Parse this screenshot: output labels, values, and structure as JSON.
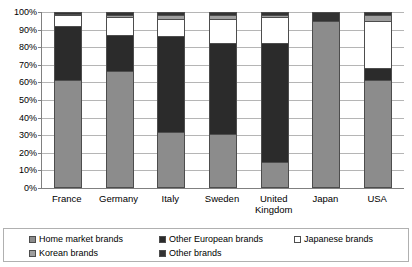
{
  "chart_data": {
    "type": "bar",
    "subtype": "stacked-100-percent",
    "title": "",
    "subtitle": "",
    "xlabel": "",
    "ylabel": "",
    "ylim": [
      0,
      100
    ],
    "y_unit": "%",
    "grid": true,
    "legend_position": "bottom",
    "categories": [
      "France",
      "Germany",
      "Italy",
      "Sweden",
      "United Kingdom",
      "Japan",
      "USA"
    ],
    "category_labels": [
      [
        "France"
      ],
      [
        "Germany"
      ],
      [
        "Italy"
      ],
      [
        "Sweden"
      ],
      [
        "United",
        "Kingdom"
      ],
      [
        "Japan"
      ],
      [
        "USA"
      ]
    ],
    "y_ticks": [
      "0%",
      "10%",
      "20%",
      "30%",
      "40%",
      "50%",
      "60%",
      "70%",
      "80%",
      "90%",
      "100%"
    ],
    "y_tick_values": [
      0,
      10,
      20,
      30,
      40,
      50,
      60,
      70,
      80,
      90,
      100
    ],
    "series": [
      {
        "name": "Home market brands",
        "color": "#8c8c8c",
        "values": [
          61,
          66,
          31,
          30,
          14,
          95,
          61
        ]
      },
      {
        "name": "Other European brands",
        "color": "#2b2b2b",
        "values": [
          31,
          21,
          55,
          52,
          68,
          0,
          7
        ]
      },
      {
        "name": "Japanese brands",
        "color": "#ffffff",
        "values": [
          6,
          10,
          10,
          14,
          15,
          0,
          27
        ]
      },
      {
        "name": "Korean brands",
        "color": "#9e9e9e",
        "values": [
          1,
          1,
          2,
          2,
          1,
          0,
          3
        ]
      },
      {
        "name": "Other brands",
        "color": "#333333",
        "values": [
          1,
          2,
          2,
          2,
          2,
          5,
          2
        ]
      }
    ]
  },
  "legend": {
    "items": [
      {
        "label": "Home market brands",
        "color": "#8c8c8c"
      },
      {
        "label": "Other European brands",
        "color": "#2b2b2b"
      },
      {
        "label": "Japanese brands",
        "color": "#ffffff"
      },
      {
        "label": "Korean brands",
        "color": "#9e9e9e"
      },
      {
        "label": "Other brands",
        "color": "#333333"
      }
    ]
  }
}
